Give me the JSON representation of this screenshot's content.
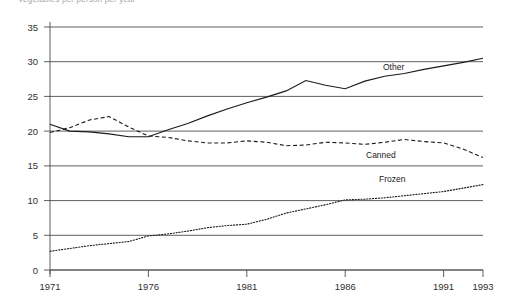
{
  "chart": {
    "title": "Vegetables per person per year",
    "y_axis": {
      "ticks": [
        "0",
        "5",
        "10",
        "15",
        "20",
        "25",
        "30",
        "35"
      ],
      "min": 0,
      "max": 35
    },
    "x_axis": {
      "ticks": [
        "1971",
        "1976",
        "1981",
        "1986",
        "1991",
        "1993"
      ],
      "min": 1971,
      "max": 1993
    },
    "labels": {
      "other": "Other",
      "canned": "Canned",
      "frozen": "Frozen"
    }
  },
  "chart_data": {
    "type": "line",
    "title": "Vegetables per person per year",
    "xlabel": "",
    "ylabel": "",
    "xlim": [
      1971,
      1993
    ],
    "ylim": [
      0,
      35
    ],
    "grid": true,
    "legend_position": "inline-annotations",
    "x": [
      1971,
      1972,
      1973,
      1974,
      1975,
      1976,
      1977,
      1978,
      1979,
      1980,
      1981,
      1982,
      1983,
      1984,
      1985,
      1986,
      1987,
      1988,
      1989,
      1990,
      1991,
      1992,
      1993
    ],
    "series": [
      {
        "name": "Other",
        "style": "solid",
        "color": "#1a1a1a",
        "values": [
          21.0,
          20.0,
          19.9,
          19.6,
          19.2,
          19.2,
          20.2,
          21.1,
          22.2,
          23.2,
          24.1,
          24.9,
          25.8,
          27.3,
          26.6,
          26.1,
          27.2,
          27.9,
          28.3,
          28.9,
          29.4,
          29.9,
          30.5
        ]
      },
      {
        "name": "Canned",
        "style": "dashed",
        "color": "#1a1a1a",
        "values": [
          19.8,
          20.5,
          21.6,
          22.1,
          20.6,
          19.3,
          19.1,
          18.6,
          18.3,
          18.3,
          18.6,
          18.4,
          17.9,
          18.0,
          18.4,
          18.3,
          18.1,
          18.4,
          18.8,
          18.5,
          18.3,
          17.4,
          16.2
        ]
      },
      {
        "name": "Frozen",
        "style": "dotted",
        "color": "#1a1a1a",
        "values": [
          2.7,
          3.1,
          3.5,
          3.8,
          4.1,
          4.9,
          5.2,
          5.6,
          6.1,
          6.4,
          6.6,
          7.3,
          8.2,
          8.8,
          9.4,
          10.1,
          10.2,
          10.4,
          10.7,
          11.0,
          11.3,
          11.8,
          12.3
        ]
      }
    ]
  }
}
